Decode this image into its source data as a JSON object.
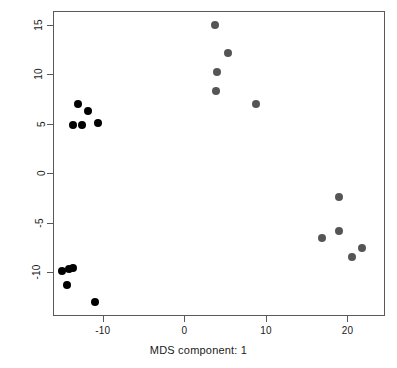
{
  "chart_data": {
    "type": "scatter",
    "title": "",
    "xlabel": "MDS component: 1",
    "ylabel": "MDS component: 2",
    "xlim": [
      -16.1,
      24.6
    ],
    "ylim": [
      -14.4,
      16.4
    ],
    "xticks": [
      -10,
      0,
      10,
      20
    ],
    "xticklabels": [
      "-10",
      "0",
      "10",
      "20"
    ],
    "yticks": [
      15,
      10,
      5,
      0,
      -5,
      -10
    ],
    "yticklabels": [
      "15",
      "10",
      "5",
      "0",
      "-5",
      "-10"
    ],
    "grid": false,
    "legend": false,
    "point_size": 4,
    "series": [
      {
        "name": "group-black",
        "color": "#000000",
        "points": [
          {
            "x": -13.0,
            "y": 7.0
          },
          {
            "x": -11.8,
            "y": 6.3
          },
          {
            "x": -13.7,
            "y": 4.9
          },
          {
            "x": -12.5,
            "y": 4.9
          },
          {
            "x": -10.6,
            "y": 5.1
          },
          {
            "x": -15.0,
            "y": -9.9
          },
          {
            "x": -14.2,
            "y": -9.7
          },
          {
            "x": -13.7,
            "y": -9.6
          },
          {
            "x": -14.4,
            "y": -11.3
          },
          {
            "x": -10.9,
            "y": -13.0
          }
        ]
      },
      {
        "name": "group-grey",
        "color": "#555555",
        "points": [
          {
            "x": 3.8,
            "y": 15.0
          },
          {
            "x": 5.4,
            "y": 12.2
          },
          {
            "x": 4.0,
            "y": 10.2
          },
          {
            "x": 3.9,
            "y": 8.3
          },
          {
            "x": 8.8,
            "y": 7.0
          },
          {
            "x": 18.9,
            "y": -2.4
          },
          {
            "x": 16.9,
            "y": -6.5
          },
          {
            "x": 18.9,
            "y": -5.8
          },
          {
            "x": 21.8,
            "y": -7.5
          },
          {
            "x": 20.6,
            "y": -8.4
          }
        ]
      }
    ],
    "axis_color": "#595959",
    "background": "#ffffff"
  },
  "axes": {
    "x_title": "MDS component: 1",
    "y_title": "MDS component: 2"
  }
}
